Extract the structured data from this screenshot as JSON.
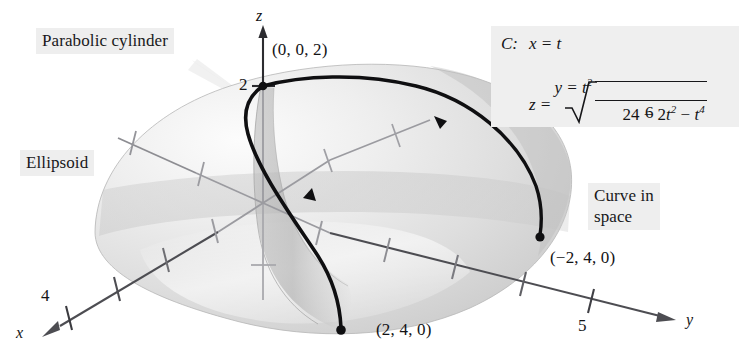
{
  "figure": {
    "surfaces": {
      "ellipsoid_label": "Ellipsoid",
      "parabolic_cylinder_label": "Parabolic cylinder",
      "curve_label": "Curve in\nspace"
    },
    "axes": {
      "x_label": "x",
      "y_label": "y",
      "z_label": "z",
      "x_tick_label": "4",
      "y_tick_label": "5",
      "z_tick_label": "2",
      "x_tick_count": 4,
      "y_tick_count": 5,
      "z_tick_count": 2
    },
    "points": [
      {
        "name": "curve-start",
        "label": "(0, 0, 2)"
      },
      {
        "name": "curve-end-front",
        "label": "(2, 4, 0)"
      },
      {
        "name": "curve-end-back",
        "label": "(−2, 4, 0)"
      }
    ],
    "equation": {
      "curve_name": "C:",
      "x_eq": "x = t",
      "y_eq_base": "y = t",
      "y_eq_exp": "2",
      "z_eq": "z =",
      "numerator": "24 − 2t² − t⁴",
      "numerator_parts": {
        "a": "24 − 2",
        "a_var": "t",
        "a_exp": "2",
        "b": " − ",
        "b_var": "t",
        "b_exp": "4"
      },
      "denominator": "6",
      "radical": "√"
    },
    "colors": {
      "background": "#ffffff",
      "callout_bg": "#eeeeee",
      "curve": "#101012",
      "axis": "#55555a",
      "axis_faint": "#9a9aa0",
      "ellipsoid_light": "#f2f2f2",
      "ellipsoid_mid": "#d8d8d8",
      "ellipsoid_dark": "#bcbcbc",
      "cylinder": "#a8a8a8",
      "text": "#141416"
    }
  }
}
